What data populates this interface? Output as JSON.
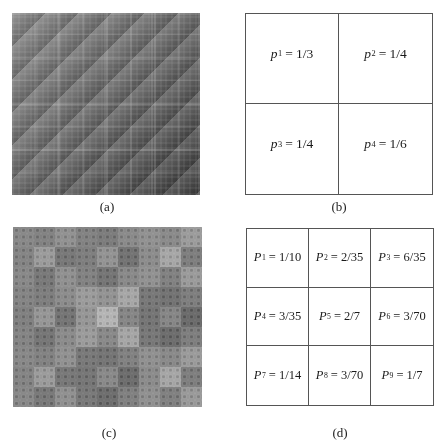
{
  "figure": {
    "panels": [
      {
        "id": "a",
        "caption": "(a)",
        "kind": "image",
        "description": "grayscale multifractal cascade, 2x2 subdivision"
      },
      {
        "id": "b",
        "caption": "(b)",
        "kind": "grid",
        "rows": 2,
        "cols": 2,
        "cells": [
          {
            "var": "p",
            "sub": "1",
            "value": "1/3"
          },
          {
            "var": "p",
            "sub": "2",
            "value": "1/4"
          },
          {
            "var": "p",
            "sub": "3",
            "value": "1/4"
          },
          {
            "var": "p",
            "sub": "4",
            "value": "1/6"
          }
        ]
      },
      {
        "id": "c",
        "caption": "(c)",
        "kind": "image",
        "description": "grayscale multifractal cascade, 3x3 subdivision"
      },
      {
        "id": "d",
        "caption": "(d)",
        "kind": "grid",
        "rows": 3,
        "cols": 3,
        "cells": [
          {
            "var": "P",
            "sub": "1",
            "value": "1/10"
          },
          {
            "var": "P",
            "sub": "2",
            "value": "2/35"
          },
          {
            "var": "P",
            "sub": "3",
            "value": "6/35"
          },
          {
            "var": "P",
            "sub": "4",
            "value": "3/35"
          },
          {
            "var": "P",
            "sub": "5",
            "value": "2/7"
          },
          {
            "var": "P",
            "sub": "6",
            "value": "3/70"
          },
          {
            "var": "P",
            "sub": "7",
            "value": "1/14"
          },
          {
            "var": "P",
            "sub": "8",
            "value": "3/70"
          },
          {
            "var": "P",
            "sub": "9",
            "value": "1/7"
          }
        ]
      }
    ],
    "equals_sign": "=",
    "cascade_a_shades": [
      "#9a9a9a",
      "#8e8e8e",
      "#8e8e8e",
      "#7a7a7a"
    ],
    "cascade_c_shades": [
      "#8a8a8a",
      "#7e7e7e",
      "#9c9c9c",
      "#828282",
      "#b0b0b0",
      "#6a6a6a",
      "#8a8a8a",
      "#6e6e6e",
      "#9a9a9a"
    ]
  }
}
